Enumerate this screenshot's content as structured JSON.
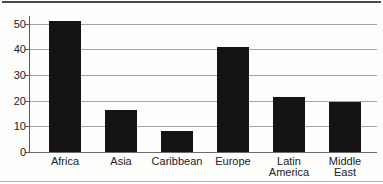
{
  "chart_data": {
    "type": "bar",
    "categories": [
      "Africa",
      "Asia",
      "Caribbean",
      "Europe",
      "Latin America",
      "Middle East"
    ],
    "values": [
      51,
      16.5,
      8,
      41,
      21.5,
      19.5
    ],
    "title": "",
    "xlabel": "",
    "ylabel": "",
    "ylim": [
      0,
      50
    ],
    "yticks": [
      0,
      10,
      20,
      30,
      40,
      50
    ],
    "grid": true,
    "legend": false,
    "colors": {
      "bar": "#141414",
      "gridline": "#a3a3a3",
      "baseline": "#6b6b6b",
      "axis": "#5a5a5a",
      "text": "#222222",
      "top_rule": "#4a4a4a",
      "bottom_rule": "#b5b5b5"
    }
  }
}
